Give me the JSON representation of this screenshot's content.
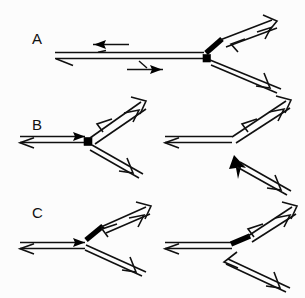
{
  "figure": {
    "background_color": "#fcfcfc",
    "ink_color": "#101010",
    "heavy_color": "#000000",
    "width": 305,
    "height": 298
  },
  "panels": [
    {
      "id": "A",
      "label": "A",
      "label_x": 32,
      "label_y": 44,
      "description": "Long horizontal duplex joined at a branch point to two diverging duplex arms; heavy black segment on the upper arm adjacent to the junction and a filled square node at the junction.",
      "junction_marker": "filled-square",
      "heavy_segments": 1,
      "arms": 3,
      "internal_arrows": [
        {
          "name": "leftward-solid-arrow",
          "direction": "left",
          "head": "solid"
        },
        {
          "name": "rightward-solid-arrow",
          "direction": "right",
          "head": "solid"
        }
      ]
    },
    {
      "id": "B",
      "label": "B",
      "label_x": 32,
      "label_y": 130,
      "description": "Left sub-panel: Y-branched duplex with a filled square node at the junction, no heavy segment. Right sub-panel: Y-branched duplex with a solid arrowhead strand entering the junction from the lower right.",
      "junction_marker": "filled-square",
      "heavy_segments": 0,
      "arms": 3
    },
    {
      "id": "C",
      "label": "C",
      "label_x": 32,
      "label_y": 218,
      "description": "Left sub-panel: Y-branched duplex with a heavy black segment on the upper-right arm at the junction. Right sub-panel: same structure with the lower arm detached and an open arrowhead pointing toward the junction.",
      "junction_marker": "heavy-segment",
      "heavy_segments": 1,
      "arms": 3
    }
  ],
  "legend": {
    "heavy_segment_meaning": "heavy black strand segment",
    "node_meaning": "branch point",
    "solid_head_meaning": "3' end (filled arrowhead)",
    "open_head_meaning": "strand polarity (open arrowhead)"
  }
}
